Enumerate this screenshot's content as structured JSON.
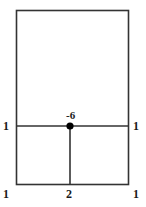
{
  "figure": {
    "type": "line-diagram",
    "background_color": "#ffffff",
    "stroke_color": "#333333",
    "node_color": "#000000",
    "label_color": "#1a1a1a",
    "canvas": {
      "width": 146,
      "height": 207
    },
    "rectangle": {
      "x": 16,
      "y": 10,
      "width": 113,
      "height": 175
    },
    "horizontal_line": {
      "x1": 16,
      "y1": 126,
      "x2": 129,
      "y2": 126
    },
    "vertical_line": {
      "x1": 70,
      "y1": 126,
      "x2": 70,
      "y2": 185
    },
    "node": {
      "cx": 70,
      "cy": 126,
      "r": 3.6
    },
    "labels": {
      "left_mid": "1",
      "right_mid": "1",
      "node": "-6",
      "bottom_left": "1",
      "bottom_mid": "2",
      "bottom_right": "1"
    }
  }
}
